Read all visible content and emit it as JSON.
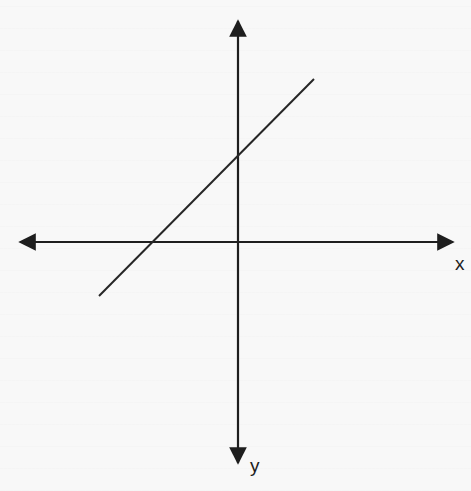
{
  "diagram": {
    "type": "coordinate-plane-with-line",
    "axes": {
      "x_label": "x",
      "y_label": "y",
      "origin_px": [
        238,
        242
      ],
      "x_axis": {
        "from": [
          18,
          242
        ],
        "to": [
          455,
          242
        ],
        "arrows": "both"
      },
      "y_axis": {
        "from": [
          238,
          19
        ],
        "to": [
          238,
          465
        ],
        "arrows": "both"
      }
    },
    "line": {
      "from": [
        99,
        296
      ],
      "to": [
        314,
        79
      ],
      "slope": "positive",
      "y_intercept": "positive (above origin)",
      "x_intercept": "negative (left of origin)",
      "y_intercept_px": [
        238,
        154
      ],
      "x_intercept_px": [
        152,
        242
      ]
    },
    "colors": {
      "ink": "#1e1e1e",
      "paper": "#f8f8f8"
    }
  }
}
